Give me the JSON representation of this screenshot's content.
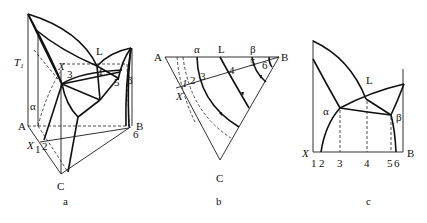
{
  "panels": {
    "a": {
      "caption": "a",
      "labels": {
        "T1_main": "T",
        "T1_sub": "1",
        "alpha": "α",
        "L": "L",
        "beta": "β",
        "A": "A",
        "B": "B",
        "C": "C",
        "X": "X",
        "X_top": "X",
        "p1": "1",
        "p2": "2",
        "p3": "3",
        "p4": "4",
        "p5": "5",
        "p6": "6"
      }
    },
    "b": {
      "caption": "b",
      "labels": {
        "A": "A",
        "B": "B",
        "C": "C",
        "X": "X",
        "alpha": "α",
        "L": "L",
        "beta": "β",
        "p1": "1",
        "p2": "2",
        "p3": "3",
        "p4": "4",
        "p5": "5",
        "p6": "6"
      }
    },
    "c": {
      "caption": "c",
      "labels": {
        "L": "L",
        "alpha": "α",
        "beta": "β",
        "X": "X",
        "B": "B",
        "ticks": [
          "1",
          "2",
          "3",
          "4",
          "5",
          "6"
        ]
      }
    }
  },
  "colors": {
    "line": "#111111",
    "background": "#ffffff"
  }
}
